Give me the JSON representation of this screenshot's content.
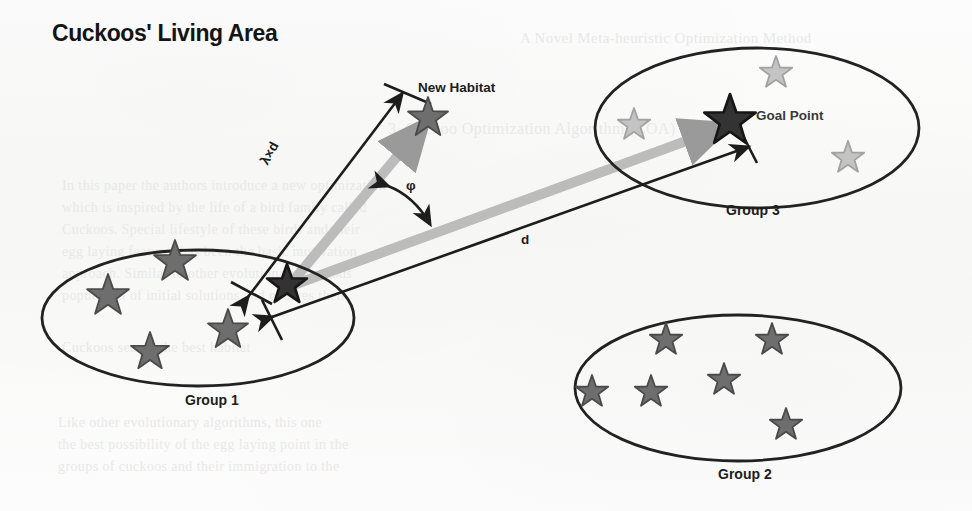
{
  "title": "Cuckoos' Living Area",
  "labels": {
    "new_habitat": "New Habitat",
    "goal_point": "Goal Point",
    "group1": "Group 1",
    "group2": "Group 2",
    "group3": "Group 3",
    "lambda_d": "λ×d",
    "phi": "φ",
    "d": "d"
  },
  "colors": {
    "background": "#fbfbfb",
    "ink": "#1d1d1d",
    "outline": "#222222",
    "star_dark": "#333333",
    "star_mid": "#6e6e6e",
    "star_light": "#c4c4c4",
    "arrow_gray": "#b4b4b4",
    "arrow_gray_dark": "#9a9a9a",
    "ghost_text": "#e9e9e8"
  },
  "chart_data": {
    "type": "diagram",
    "title": "Cuckoos' Living Area",
    "annotations": [
      {
        "name": "lambda_d",
        "text": "λ×d",
        "meaning": "egg laying radius (lambda times d)"
      },
      {
        "name": "d",
        "text": "d",
        "meaning": "distance from current habitat to goal point"
      },
      {
        "name": "phi",
        "text": "φ",
        "meaning": "deviation angle between migration vectors"
      }
    ],
    "groups": [
      {
        "name": "Group 1",
        "label": "Group 1",
        "ellipse": {
          "cx": 198,
          "cy": 318,
          "rx": 156,
          "ry": 68
        },
        "star_style": "mid",
        "stars": [
          {
            "x": 108,
            "y": 296,
            "r": 22
          },
          {
            "x": 175,
            "y": 262,
            "r": 22
          },
          {
            "x": 150,
            "y": 352,
            "r": 20
          },
          {
            "x": 228,
            "y": 330,
            "r": 21
          }
        ],
        "source_star": {
          "x": 287,
          "y": 285,
          "r": 21,
          "style": "dark"
        }
      },
      {
        "name": "Group 2",
        "label": "Group 2",
        "ellipse": {
          "cx": 738,
          "cy": 388,
          "rx": 163,
          "ry": 73
        },
        "star_style": "mid",
        "stars": [
          {
            "x": 666,
            "y": 340,
            "r": 17
          },
          {
            "x": 772,
            "y": 340,
            "r": 17
          },
          {
            "x": 592,
            "y": 392,
            "r": 17
          },
          {
            "x": 651,
            "y": 392,
            "r": 17
          },
          {
            "x": 724,
            "y": 380,
            "r": 17
          },
          {
            "x": 786,
            "y": 425,
            "r": 17
          }
        ]
      },
      {
        "name": "Group 3",
        "label": "Group 3",
        "ellipse": {
          "cx": 757,
          "cy": 128,
          "rx": 162,
          "ry": 80
        },
        "star_style": "light",
        "stars": [
          {
            "x": 776,
            "y": 73,
            "r": 17
          },
          {
            "x": 634,
            "y": 125,
            "r": 17
          },
          {
            "x": 848,
            "y": 158,
            "r": 17
          }
        ],
        "goal_star": {
          "x": 730,
          "y": 121,
          "r": 27,
          "style": "dark"
        }
      }
    ],
    "habitat": {
      "label": "New Habitat",
      "star": {
        "x": 428,
        "y": 118,
        "r": 21,
        "style": "mid"
      }
    },
    "vectors": [
      {
        "name": "to-new-habitat",
        "from": [
          287,
          285
        ],
        "to": [
          425,
          120
        ],
        "color": "#b4b4b4",
        "width": 9
      },
      {
        "name": "to-goal-point",
        "from": [
          287,
          285
        ],
        "to": [
          726,
          124
        ],
        "color": "#b4b4b4",
        "width": 9
      },
      {
        "name": "radius-dimension",
        "from": [
          250,
          290
        ],
        "to": [
          400,
          96
        ],
        "color": "#1d1d1d",
        "width": 2.4
      },
      {
        "name": "distance-dimension",
        "from": [
          268,
          315
        ],
        "to": [
          752,
          146
        ],
        "color": "#1d1d1d",
        "width": 2.4
      },
      {
        "name": "angle-arc",
        "from": [
          388,
          186
        ],
        "to": [
          434,
          222
        ],
        "color": "#1d1d1d",
        "width": 2.4
      }
    ]
  },
  "ghost_text": [
    {
      "text": "A Novel Meta-heuristic Optimization Method",
      "x": 520,
      "y": 30,
      "size": 15
    },
    {
      "text": "3. Cuckoo Optimization Algorithm (COA)",
      "x": 388,
      "y": 120,
      "size": 16
    },
    {
      "text": "In this paper the authors introduce a new optimization",
      "x": 62,
      "y": 178,
      "size": 14
    },
    {
      "text": "which is inspired by the life of a bird family called",
      "x": 62,
      "y": 200,
      "size": 14
    },
    {
      "text": "Cuckoos. Special lifestyle of these birds and their",
      "x": 62,
      "y": 222,
      "size": 14
    },
    {
      "text": "egg laying features has been the basic motivation",
      "x": 62,
      "y": 244,
      "size": 14
    },
    {
      "text": "approach. Similar to other evolutionary methods",
      "x": 62,
      "y": 266,
      "size": 14
    },
    {
      "text": "population of initial solutions and evolves them",
      "x": 62,
      "y": 288,
      "size": 14
    },
    {
      "text": "Cuckoos search the best habitat",
      "x": 62,
      "y": 340,
      "size": 14
    },
    {
      "text": "Like other evolutionary algorithms, this one",
      "x": 58,
      "y": 415,
      "size": 14
    },
    {
      "text": "the best possibility of the egg laying point in the",
      "x": 58,
      "y": 437,
      "size": 14
    },
    {
      "text": "groups of cuckoos and their immigration to the",
      "x": 58,
      "y": 459,
      "size": 14
    }
  ]
}
